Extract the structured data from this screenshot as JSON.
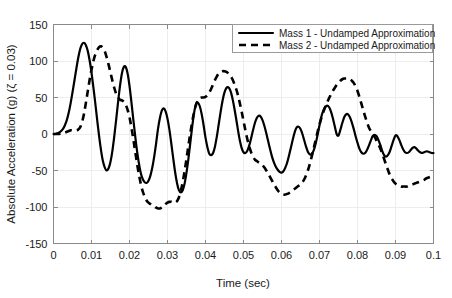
{
  "chart_data": {
    "type": "line",
    "title": "",
    "xlabel": "Time (sec)",
    "ylabel": "Absolute Acceleration (g) (ζ = 0.03)",
    "xlim": [
      0,
      0.1
    ],
    "ylim": [
      -150,
      150
    ],
    "xticks": [
      0,
      0.01,
      0.02,
      0.03,
      0.04,
      0.05,
      0.06,
      0.07,
      0.08,
      0.09,
      0.1
    ],
    "xticklabels": [
      "0",
      "0.01",
      "0.02",
      "0.03",
      "0.04",
      "0.05",
      "0.06",
      "0.07",
      "0.08",
      "0.09",
      "0.1"
    ],
    "yticks": [
      -150,
      -100,
      -50,
      0,
      50,
      100,
      150
    ],
    "yticklabels": [
      "-150",
      "-100",
      "-50",
      "0",
      "50",
      "100",
      "150"
    ],
    "grid": true,
    "legend_position": "upper right",
    "series": [
      {
        "name": "Mass 1 - Undamped Approximation",
        "style": "solid",
        "color": "#000000",
        "x": [
          0.0,
          0.0005,
          0.001,
          0.0015,
          0.002,
          0.0025,
          0.003,
          0.0035,
          0.004,
          0.0045,
          0.005,
          0.0055,
          0.006,
          0.0065,
          0.007,
          0.0075,
          0.008,
          0.0085,
          0.009,
          0.0095,
          0.01,
          0.0105,
          0.011,
          0.0115,
          0.012,
          0.0125,
          0.013,
          0.0135,
          0.014,
          0.0145,
          0.015,
          0.0155,
          0.016,
          0.0165,
          0.017,
          0.0175,
          0.018,
          0.0185,
          0.019,
          0.0195,
          0.02,
          0.0205,
          0.021,
          0.0215,
          0.022,
          0.0225,
          0.023,
          0.0235,
          0.024,
          0.0245,
          0.025,
          0.0255,
          0.026,
          0.0265,
          0.027,
          0.0275,
          0.028,
          0.0285,
          0.029,
          0.0295,
          0.03,
          0.0305,
          0.031,
          0.0315,
          0.032,
          0.0325,
          0.033,
          0.0335,
          0.034,
          0.0345,
          0.035,
          0.0355,
          0.036,
          0.0365,
          0.037,
          0.0375,
          0.038,
          0.0385,
          0.039,
          0.0395,
          0.04,
          0.0405,
          0.041,
          0.0415,
          0.042,
          0.0425,
          0.043,
          0.0435,
          0.044,
          0.0445,
          0.045,
          0.0455,
          0.046,
          0.0465,
          0.047,
          0.0475,
          0.048,
          0.0485,
          0.049,
          0.0495,
          0.05,
          0.0505,
          0.051,
          0.0515,
          0.052,
          0.0525,
          0.053,
          0.0535,
          0.054,
          0.0545,
          0.055,
          0.0555,
          0.056,
          0.0565,
          0.057,
          0.0575,
          0.058,
          0.0585,
          0.059,
          0.0595,
          0.06,
          0.0605,
          0.061,
          0.0615,
          0.062,
          0.0625,
          0.063,
          0.0635,
          0.064,
          0.0645,
          0.065,
          0.0655,
          0.066,
          0.0665,
          0.067,
          0.0675,
          0.068,
          0.0685,
          0.069,
          0.0695,
          0.07,
          0.0705,
          0.071,
          0.0715,
          0.072,
          0.0725,
          0.073,
          0.0735,
          0.074,
          0.0745,
          0.075,
          0.0755,
          0.076,
          0.0765,
          0.077,
          0.0775,
          0.078,
          0.0785,
          0.079,
          0.0795,
          0.08,
          0.0805,
          0.081,
          0.0815,
          0.082,
          0.0825,
          0.083,
          0.0835,
          0.084,
          0.0845,
          0.085,
          0.0855,
          0.086,
          0.0865,
          0.087,
          0.0875,
          0.088,
          0.0885,
          0.089,
          0.0895,
          0.09,
          0.0905,
          0.091,
          0.0915,
          0.092,
          0.0925,
          0.093,
          0.0935,
          0.094,
          0.0945,
          0.095,
          0.0955,
          0.096,
          0.0965,
          0.097,
          0.0975,
          0.098,
          0.0985,
          0.099,
          0.0995,
          0.1
        ],
        "y": [
          0,
          0,
          1,
          2,
          4,
          7,
          12,
          19,
          29,
          42,
          57,
          73,
          89,
          104,
          116,
          123,
          125,
          122,
          114,
          101,
          84,
          64,
          42,
          19,
          -3,
          -22,
          -37,
          -46,
          -50,
          -47,
          -38,
          -23,
          -3,
          20,
          44,
          66,
          83,
          92,
          92,
          83,
          66,
          44,
          20,
          -3,
          -24,
          -41,
          -54,
          -62,
          -66,
          -67,
          -64,
          -57,
          -46,
          -31,
          -13,
          7,
          22,
          32,
          35,
          31,
          21,
          6,
          -13,
          -33,
          -52,
          -67,
          -77,
          -80,
          -77,
          -68,
          -53,
          -34,
          -12,
          10,
          29,
          41,
          43,
          38,
          27,
          12,
          -5,
          -18,
          -27,
          -29,
          -26,
          -17,
          -3,
          14,
          31,
          46,
          57,
          63,
          64,
          60,
          51,
          38,
          23,
          7,
          -8,
          -19,
          -25,
          -26,
          -23,
          -16,
          -6,
          5,
          15,
          22,
          25,
          24,
          19,
          11,
          1,
          -10,
          -21,
          -31,
          -39,
          -45,
          -49,
          -52,
          -53,
          -51,
          -46,
          -39,
          -29,
          -18,
          -7,
          3,
          9,
          10,
          7,
          0,
          -9,
          -18,
          -25,
          -28,
          -27,
          -22,
          -13,
          -1,
          12,
          24,
          32,
          37,
          39,
          37,
          31,
          22,
          11,
          0,
          -2,
          6,
          15,
          23,
          27,
          27,
          23,
          16,
          7,
          -3,
          -12,
          -20,
          -25,
          -27,
          -26,
          -22,
          -16,
          -9,
          -3,
          -1,
          -3,
          -8,
          -15,
          -23,
          -29,
          -31,
          -29,
          -24,
          -16,
          -8,
          -2,
          -3,
          -8,
          -15,
          -21,
          -25,
          -26,
          -25,
          -22,
          -19,
          -18,
          -20,
          -23,
          -25,
          -26,
          -25,
          -24,
          -24,
          -25,
          -26,
          -26
        ]
      },
      {
        "name": "Mass 2 - Undamped Approximation",
        "style": "dashed",
        "color": "#000000",
        "x": [
          0.0,
          0.0005,
          0.001,
          0.0015,
          0.002,
          0.0025,
          0.003,
          0.0035,
          0.004,
          0.0045,
          0.005,
          0.0055,
          0.006,
          0.0065,
          0.007,
          0.0075,
          0.008,
          0.0085,
          0.009,
          0.0095,
          0.01,
          0.0105,
          0.011,
          0.0115,
          0.012,
          0.0125,
          0.013,
          0.0135,
          0.014,
          0.0145,
          0.015,
          0.0155,
          0.016,
          0.0165,
          0.017,
          0.0175,
          0.018,
          0.0185,
          0.019,
          0.0195,
          0.02,
          0.0205,
          0.021,
          0.0215,
          0.022,
          0.0225,
          0.023,
          0.0235,
          0.024,
          0.0245,
          0.025,
          0.0255,
          0.026,
          0.0265,
          0.027,
          0.0275,
          0.028,
          0.0285,
          0.029,
          0.0295,
          0.03,
          0.0305,
          0.031,
          0.0315,
          0.032,
          0.0325,
          0.033,
          0.0335,
          0.034,
          0.0345,
          0.035,
          0.0355,
          0.036,
          0.0365,
          0.037,
          0.0375,
          0.038,
          0.0385,
          0.039,
          0.0395,
          0.04,
          0.0405,
          0.041,
          0.0415,
          0.042,
          0.0425,
          0.043,
          0.0435,
          0.044,
          0.0445,
          0.045,
          0.0455,
          0.046,
          0.0465,
          0.047,
          0.0475,
          0.048,
          0.0485,
          0.049,
          0.0495,
          0.05,
          0.0505,
          0.051,
          0.0515,
          0.052,
          0.0525,
          0.053,
          0.0535,
          0.054,
          0.0545,
          0.055,
          0.0555,
          0.056,
          0.0565,
          0.057,
          0.0575,
          0.058,
          0.0585,
          0.059,
          0.0595,
          0.06,
          0.0605,
          0.061,
          0.0615,
          0.062,
          0.0625,
          0.063,
          0.0635,
          0.064,
          0.0645,
          0.065,
          0.0655,
          0.066,
          0.0665,
          0.067,
          0.0675,
          0.068,
          0.0685,
          0.069,
          0.0695,
          0.07,
          0.0705,
          0.071,
          0.0715,
          0.072,
          0.0725,
          0.073,
          0.0735,
          0.074,
          0.0745,
          0.075,
          0.0755,
          0.076,
          0.0765,
          0.077,
          0.0775,
          0.078,
          0.0785,
          0.079,
          0.0795,
          0.08,
          0.0805,
          0.081,
          0.0815,
          0.082,
          0.0825,
          0.083,
          0.0835,
          0.084,
          0.0845,
          0.085,
          0.0855,
          0.086,
          0.0865,
          0.087,
          0.0875,
          0.088,
          0.0885,
          0.089,
          0.0895,
          0.09,
          0.0905,
          0.091,
          0.0915,
          0.092,
          0.0925,
          0.093,
          0.0935,
          0.094,
          0.0945,
          0.095,
          0.0955,
          0.096,
          0.0965,
          0.097,
          0.0975,
          0.098,
          0.0985,
          0.099,
          0.0995,
          0.1
        ],
        "y": [
          0,
          0,
          0,
          0,
          1,
          1,
          2,
          3,
          4,
          5,
          5,
          5,
          5,
          6,
          9,
          16,
          27,
          42,
          58,
          74,
          88,
          100,
          109,
          115,
          119,
          120,
          118,
          113,
          105,
          95,
          84,
          73,
          63,
          55,
          50,
          47,
          46,
          44,
          40,
          33,
          23,
          9,
          -7,
          -24,
          -41,
          -56,
          -69,
          -79,
          -86,
          -91,
          -94,
          -96,
          -98,
          -99,
          -101,
          -102,
          -102,
          -101,
          -99,
          -96,
          -94,
          -93,
          -93,
          -94,
          -94,
          -92,
          -87,
          -78,
          -66,
          -51,
          -34,
          -16,
          1,
          17,
          30,
          40,
          46,
          49,
          50,
          50,
          51,
          53,
          57,
          62,
          68,
          74,
          79,
          83,
          85,
          86,
          86,
          85,
          83,
          80,
          76,
          70,
          63,
          54,
          43,
          31,
          18,
          5,
          -7,
          -17,
          -25,
          -31,
          -35,
          -37,
          -39,
          -41,
          -43,
          -46,
          -50,
          -54,
          -59,
          -64,
          -69,
          -73,
          -77,
          -80,
          -82,
          -83,
          -83,
          -82,
          -81,
          -79,
          -77,
          -75,
          -73,
          -71,
          -69,
          -66,
          -62,
          -56,
          -49,
          -40,
          -30,
          -19,
          -8,
          3,
          13,
          22,
          30,
          37,
          43,
          49,
          54,
          59,
          63,
          67,
          70,
          73,
          75,
          76,
          76,
          76,
          75,
          73,
          70,
          65,
          59,
          51,
          42,
          33,
          24,
          16,
          9,
          4,
          0,
          -4,
          -9,
          -14,
          -20,
          -27,
          -34,
          -42,
          -49,
          -56,
          -61,
          -65,
          -68,
          -70,
          -71,
          -72,
          -72,
          -72,
          -72,
          -71,
          -70,
          -69,
          -68,
          -67,
          -66,
          -65,
          -64,
          -63,
          -61,
          -60,
          -59,
          -58,
          -57
        ]
      }
    ]
  },
  "legend": {
    "entries": [
      {
        "label": "Mass 1 - Undamped Approximation",
        "style": "solid"
      },
      {
        "label": "Mass 2 - Undamped Approximation",
        "style": "dashed"
      }
    ]
  }
}
